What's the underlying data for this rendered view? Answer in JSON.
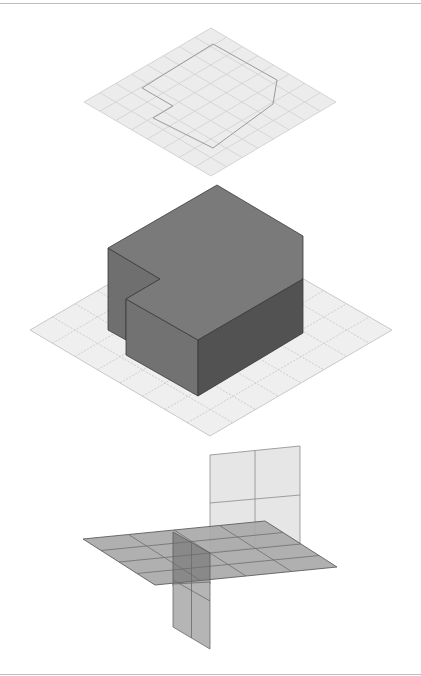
{
  "figure": {
    "colors": {
      "background": "#ffffff",
      "rule": "#bdbdbd",
      "grid_fill": "#ececec",
      "grid_line": "#c4c4c4",
      "outline": "#9a9a9a",
      "block_top": "#7a7a7a",
      "block_side_dark": "#545454",
      "block_edge": "#3a3a3a",
      "plane_fill": "#a9a9a9",
      "plane_line": "#6e6e6e",
      "vplane_back": "#e4e4e4",
      "vplane_front": "#b8b8b8"
    },
    "panels": [
      {
        "name": "plan-view",
        "label": "Footprint outline on grid"
      },
      {
        "name": "extruded-block",
        "label": "Extruded block on grid"
      },
      {
        "name": "intersecting-planes",
        "label": "Horizontal and vertical planes"
      }
    ]
  }
}
